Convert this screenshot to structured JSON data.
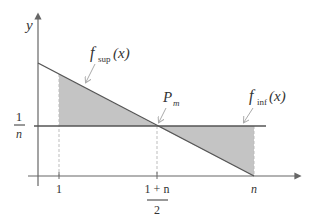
{
  "diagram": {
    "type": "area-between-lines",
    "axes": {
      "y_label": "y",
      "x_ticks": [
        {
          "label": "1"
        },
        {
          "label_num": "1 + n",
          "label_den": "2"
        },
        {
          "label": "n"
        }
      ],
      "y_ticks": [
        {
          "label_num": "1",
          "label_den": "n"
        }
      ]
    },
    "curves": [
      {
        "name": "f",
        "subscript": "sup",
        "arg": "(x)",
        "description": "decreasing line from y-axis to (n, 0)"
      },
      {
        "name": "f",
        "subscript": "inf",
        "arg": "(x)",
        "description": "horizontal line at y = 1/n"
      }
    ],
    "points": [
      {
        "name": "P",
        "subscript": "m",
        "description": "intersection at x = (1+n)/2, y = 1/n"
      }
    ],
    "colors": {
      "shade": "#c4c4c4",
      "line": "#555555",
      "axis": "#666666",
      "dashed": "#bdbdbd"
    }
  }
}
